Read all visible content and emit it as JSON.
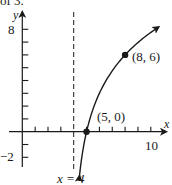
{
  "header_fragment": "of 3.",
  "chart_data": {
    "type": "line",
    "title": "",
    "function": "y = 3·log2(x − 4)",
    "xlabel": "x",
    "ylabel": "y",
    "xlim": [
      -1,
      11
    ],
    "ylim": [
      -3,
      9
    ],
    "x_ticks": [
      1,
      2,
      3,
      4,
      5,
      6,
      7,
      8,
      9,
      10
    ],
    "x_tick_labels": {
      "10": "10"
    },
    "y_ticks": [
      -2,
      -1,
      1,
      2,
      3,
      4,
      5,
      6,
      7,
      8
    ],
    "y_tick_labels": {
      "8": "8",
      "-2": "−2"
    },
    "asymptote": {
      "x": 4,
      "label": "x = 4",
      "style": "dashed"
    },
    "curve_domain": [
      4.45,
      10.6
    ],
    "points": [
      {
        "x": 5,
        "y": 0,
        "label": "(5, 0)"
      },
      {
        "x": 8,
        "y": 6,
        "label": "(8, 6)"
      }
    ],
    "grid": false,
    "legend": null
  },
  "labels": {
    "y_axis": "y",
    "x_axis": "x",
    "y8": "8",
    "ym2": "−2",
    "x10": "10",
    "asymptote": "x = 4",
    "p1": "(5, 0)",
    "p2": "(8, 6)"
  },
  "colors": {
    "ink": "#1a1a1a",
    "background": "#ffffff"
  }
}
